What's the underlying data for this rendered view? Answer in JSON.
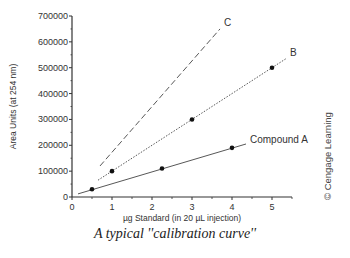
{
  "chart_data": {
    "type": "line",
    "xlabel": "µg Standard (in 20 µL injection)",
    "ylabel": "Area Units (at 254 nm)",
    "xlim": [
      0,
      5.5
    ],
    "ylim": [
      0,
      700000
    ],
    "x_ticks": [
      "0",
      "1",
      "2",
      "3",
      "4",
      "5"
    ],
    "y_ticks": [
      "0",
      "100000",
      "200000",
      "300000",
      "400000",
      "500000",
      "600000",
      "700000"
    ],
    "grid": false,
    "legend": "inline labels at line ends",
    "series": [
      {
        "name": "Compound A",
        "style": "solid",
        "points": [
          [
            0.5,
            30000
          ],
          [
            2.25,
            110000
          ],
          [
            4.0,
            190000
          ]
        ],
        "line": [
          [
            0.15,
            12000
          ],
          [
            4.35,
            205000
          ]
        ]
      },
      {
        "name": "B",
        "style": "dotted",
        "points": [
          [
            1,
            100000
          ],
          [
            3,
            300000
          ],
          [
            5,
            500000
          ]
        ],
        "line": [
          [
            0.65,
            65000
          ],
          [
            5.35,
            535000
          ]
        ]
      },
      {
        "name": "C",
        "style": "dashed",
        "points": [],
        "line": [
          [
            0.7,
            120000
          ],
          [
            3.7,
            650000
          ]
        ]
      }
    ],
    "annotations": [
      "© Cengage Learning"
    ]
  },
  "labels": {
    "caption": "A typical ''calibration curve''",
    "credit": "© Cengage Learning",
    "xlabel": "µg Standard (in 20 µL injection)",
    "ylabel": "Area Units (at 254 nm)"
  }
}
